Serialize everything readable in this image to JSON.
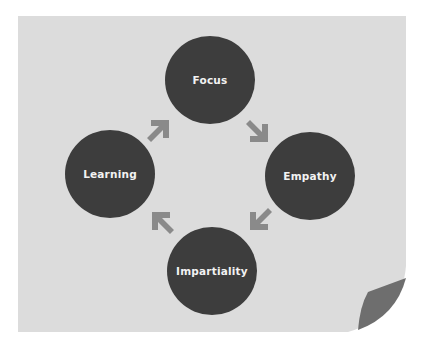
{
  "diagram": {
    "type": "cycle",
    "nodes": [
      {
        "label": "Focus"
      },
      {
        "label": "Empathy"
      },
      {
        "label": "Impartiality"
      },
      {
        "label": "Learning"
      }
    ],
    "flow": [
      "Focus",
      "Empathy",
      "Impartiality",
      "Learning",
      "Focus"
    ],
    "colors": {
      "background": "#dcdcdc",
      "node": "#3d3d3d",
      "arrow": "#8a8a8a",
      "text": "#f2f2f2",
      "curl": "#6e6e6e"
    }
  }
}
